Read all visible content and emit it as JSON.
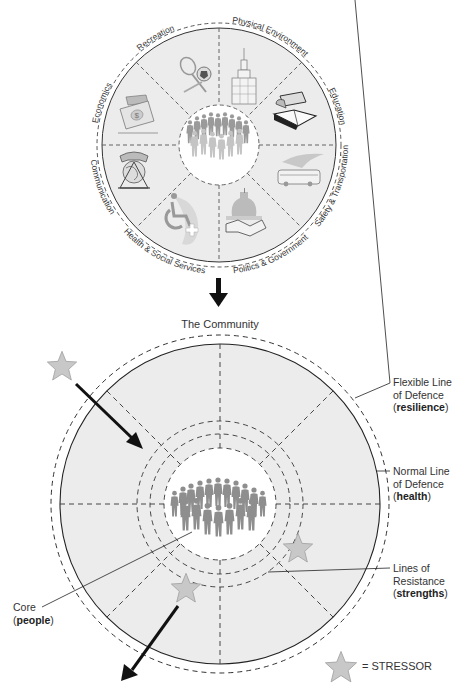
{
  "top_diagram": {
    "sectors": [
      {
        "label": "Recreation",
        "icon": "sports-equipment-icon"
      },
      {
        "label": "Physical Environment",
        "icon": "skyscraper-icon"
      },
      {
        "label": "Education",
        "icon": "books-icon"
      },
      {
        "label": "Safety & Transportation",
        "icon": "bus-icon"
      },
      {
        "label": "Politics & Government",
        "icon": "capitol-handshake-icon"
      },
      {
        "label": "Health & Social Services",
        "icon": "wheelchair-cross-icon"
      },
      {
        "label": "Communication",
        "icon": "telephone-globe-icon"
      },
      {
        "label": "Economics",
        "icon": "money-icon"
      }
    ],
    "core_icon": "crowd-icon"
  },
  "arrow_down_icon": "arrow-down-icon",
  "bottom_diagram": {
    "title": "The Community",
    "labels": {
      "flexible_line": {
        "line1": "Flexible Line",
        "line2": "of Defence",
        "paren_open": "(",
        "bold": "resilience",
        "paren_close": ")"
      },
      "normal_line": {
        "line1": "Normal Line",
        "line2": "of Defence",
        "paren_open": "(",
        "bold": "health",
        "paren_close": ")"
      },
      "lines_of_resistance": {
        "line1": "Lines of",
        "line2": "Resistance",
        "paren_open": "(",
        "bold": "strengths",
        "paren_close": ")"
      },
      "core": {
        "line1": "Core",
        "paren_open": "(",
        "bold": "people",
        "paren_close": ")"
      }
    },
    "legend": {
      "text": "= STRESSOR",
      "icon": "star-icon"
    }
  },
  "colors": {
    "sector_fill": "#ececec",
    "core_fill": "#ffffff",
    "stroke": "#333333",
    "star_fill": "#c8c8c8",
    "star_stroke": "#9a9a9a",
    "arrow": "#111111",
    "crowd": "#8a8a8a"
  }
}
